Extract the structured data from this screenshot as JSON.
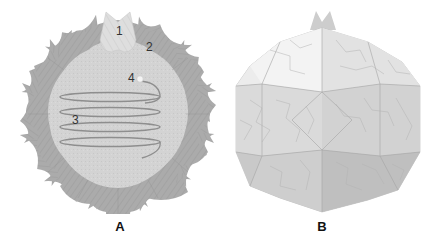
{
  "figure": {
    "panels": [
      {
        "id": "A",
        "label": "A",
        "description": "Unfolded flat net: central light disc surrounded by 12 darker scalloped petals with a crown tab at top and a spiral coil drawn across the disc",
        "callouts": [
          {
            "number": "1",
            "target": "crown-tab"
          },
          {
            "number": "2",
            "target": "petal-segment"
          },
          {
            "number": "3",
            "target": "spiral-coil"
          },
          {
            "number": "4",
            "target": "coil-end-dot"
          }
        ]
      },
      {
        "id": "B",
        "label": "B",
        "description": "Folded 3D polyhedral sphere with faceted tessellated panels and a crown tab at top"
      }
    ],
    "colors": {
      "background": "#ffffff",
      "disc_fill": "#d2d2d2",
      "petal_fill": "#a9a9a9",
      "crown_fill": "#dcdcdc",
      "coil_stroke": "#8c8c8c",
      "sphere_light": "#e8e8e8",
      "sphere_mid": "#d4d4d4",
      "sphere_dark": "#bdbdbd",
      "edge_lines": "#9a9a9a",
      "label_text": "#111111"
    }
  }
}
